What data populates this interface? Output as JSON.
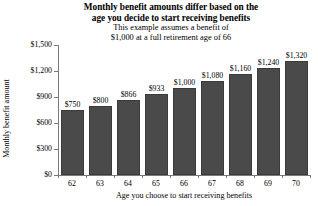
{
  "chart_data": {
    "type": "bar",
    "title": "Monthly benefit amounts differ based on the age you decide to start receiving benefits",
    "title_lines": [
      "Monthly benefit amounts differ based on the",
      "age you decide to start receiving benefits"
    ],
    "subtitle": "This example assumes a benefit of $1,000 at a full retirement age of 66",
    "subtitle_lines": [
      "This example assumes a benefit of",
      "$1,000 at a full retirement age of 66"
    ],
    "xlabel": "Age you choose to start receiving benefits",
    "ylabel": "Monthly benefit amount",
    "categories": [
      "62",
      "63",
      "64",
      "65",
      "66",
      "67",
      "68",
      "69",
      "70"
    ],
    "values": [
      750,
      800,
      866,
      933,
      1000,
      1080,
      1160,
      1240,
      1320
    ],
    "value_labels": [
      "$750",
      "$800",
      "$866",
      "$933",
      "$1,000",
      "$1,080",
      "$1,160",
      "$1,240",
      "$1,320"
    ],
    "ylim": [
      0,
      1500
    ],
    "ytick_values": [
      0,
      300,
      600,
      900,
      1200,
      1500
    ],
    "ytick_labels": [
      "$0",
      "$300",
      "$600",
      "$900",
      "$1,200",
      "$1,500"
    ],
    "grid": false,
    "legend": null,
    "bar_color": "#4a4a4a",
    "axis_color": "#7a7a7a",
    "background_color": "#ffffff"
  }
}
